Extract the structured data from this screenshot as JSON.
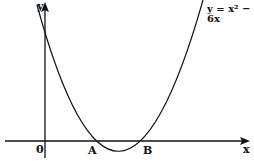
{
  "diagram": {
    "equation_label": "y = x² − 6x",
    "axis_x_label": "x",
    "axis_y_label": "y",
    "origin_label": "0",
    "point_a_label": "A",
    "point_b_label": "B",
    "colors": {
      "stroke": "#111111",
      "background": "#ffffff"
    }
  }
}
